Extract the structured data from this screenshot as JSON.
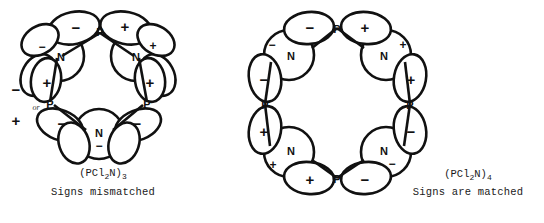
{
  "figure": {
    "background_color": "#ffffff",
    "ink_color": "#111111"
  },
  "structures": [
    {
      "id": "trimer",
      "formula_base": "(PCl",
      "formula_sub1": "2",
      "formula_mid": "N)",
      "formula_sub2": "3",
      "formula_plain": "(PCl2N)3",
      "caption": "Signs mismatched",
      "ring_size": 3,
      "phosphorus_label": "P",
      "nitrogen_label": "N",
      "annotation": "or",
      "atoms": [
        {
          "name": "p-top",
          "label": "P",
          "lobes": [
            "-",
            "+"
          ]
        },
        {
          "name": "p-lower-left",
          "label": "P",
          "lobes": [
            "+",
            "-"
          ]
        },
        {
          "name": "p-lower-right",
          "label": "P",
          "lobes": [
            "+",
            "-"
          ]
        },
        {
          "name": "n-upper-left",
          "label": "N",
          "sign": "-"
        },
        {
          "name": "n-upper-right",
          "label": "N",
          "sign": "+"
        },
        {
          "name": "n-bottom",
          "label": "N",
          "sign": "-"
        }
      ],
      "extra_signs": [
        "-",
        "+"
      ]
    },
    {
      "id": "tetramer",
      "formula_base": "(PCl",
      "formula_sub1": "2",
      "formula_mid": "N)",
      "formula_sub2": "4",
      "formula_plain": "(PCl2N)4",
      "caption": "Signs are matched",
      "ring_size": 4,
      "phosphorus_label": "P",
      "nitrogen_label": "N",
      "atoms": [
        {
          "name": "p-top",
          "label": "P",
          "lobes": [
            "-",
            "+"
          ]
        },
        {
          "name": "p-right",
          "label": "P",
          "lobes": [
            "+",
            "-"
          ]
        },
        {
          "name": "p-bottom",
          "label": "P",
          "lobes": [
            "+",
            "-"
          ]
        },
        {
          "name": "p-left",
          "label": "P",
          "lobes": [
            "-",
            "+"
          ]
        },
        {
          "name": "n-top-left",
          "label": "N",
          "sign": "-"
        },
        {
          "name": "n-top-right",
          "label": "N",
          "sign": "+"
        },
        {
          "name": "n-bottom-right",
          "label": "N",
          "sign": "-"
        },
        {
          "name": "n-bottom-left",
          "label": "N",
          "sign": "+"
        }
      ]
    }
  ],
  "signs": {
    "plus": "+",
    "minus": "−"
  }
}
